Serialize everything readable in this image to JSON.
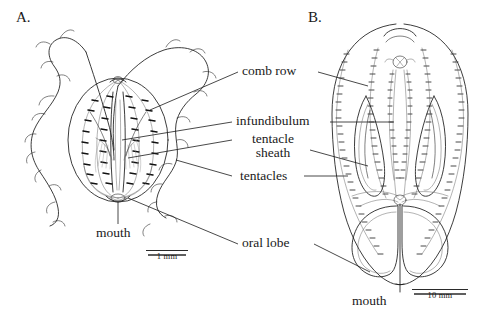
{
  "figure": {
    "kind": "scientific-illustration",
    "background_color": "#ffffff",
    "ink_color": "#1a1a1a"
  },
  "panels": [
    {
      "id": "A",
      "label": "A.",
      "view": "whole animal with extended tentacles"
    },
    {
      "id": "B",
      "label": "B.",
      "view": "oral view with oral lobes"
    }
  ],
  "callouts": [
    {
      "id": "comb-row",
      "text": "comb row",
      "lines": [
        "comb row"
      ]
    },
    {
      "id": "infundibulum",
      "text": "infundibulum",
      "lines": [
        "infundibulum"
      ]
    },
    {
      "id": "tentacle-sheath",
      "text": "tentacle sheath",
      "lines": [
        "tentacle",
        "sheath"
      ]
    },
    {
      "id": "tentacles",
      "text": "tentacles",
      "lines": [
        "tentacles"
      ]
    },
    {
      "id": "oral-lobe",
      "text": "oral lobe",
      "lines": [
        "oral lobe"
      ]
    },
    {
      "id": "mouth-a",
      "text": "mouth",
      "lines": [
        "mouth"
      ]
    },
    {
      "id": "mouth-b",
      "text": "mouth",
      "lines": [
        "mouth"
      ]
    }
  ],
  "scale_bars": [
    {
      "id": "scale-a",
      "label": "1 mm",
      "panel": "A"
    },
    {
      "id": "scale-b",
      "label": "10 mm",
      "panel": "B"
    }
  ],
  "callout_text": {
    "comb_row": "comb row",
    "infundibulum": "infundibulum",
    "tentacle_line1": "tentacle",
    "tentacle_line2": "sheath",
    "tentacles": "tentacles",
    "oral_lobe": "oral lobe",
    "mouth_a": "mouth",
    "mouth_b": "mouth"
  },
  "panel_text": {
    "a": "A.",
    "b": "B."
  },
  "scale_text": {
    "a": "1 mm",
    "b": "10 mm"
  }
}
